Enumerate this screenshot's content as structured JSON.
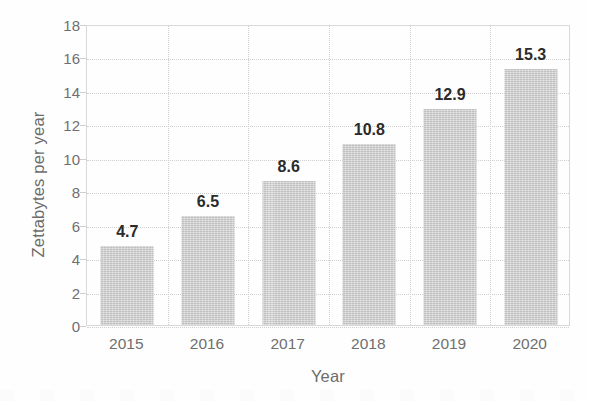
{
  "chart_data": {
    "type": "bar",
    "title": "",
    "subtitle": "",
    "xlabel": "Year",
    "ylabel": "Zettabytes per year",
    "categories": [
      "2015",
      "2016",
      "2017",
      "2018",
      "2019",
      "2020"
    ],
    "values": [
      4.7,
      6.5,
      8.6,
      10.8,
      12.9,
      15.3
    ],
    "data_labels": [
      "4.7",
      "6.5",
      "8.6",
      "10.8",
      "12.9",
      "15.3"
    ],
    "ylim": [
      0,
      18
    ],
    "ytick_values": [
      0,
      2,
      4,
      6,
      8,
      10,
      12,
      14,
      16,
      18
    ],
    "ytick_labels": [
      "0",
      "2",
      "4",
      "6",
      "8",
      "10",
      "12",
      "14",
      "16",
      "18"
    ],
    "grid": {
      "horizontal": true,
      "vertical": true,
      "style": "dotted",
      "color": "#cfcfcf"
    },
    "legend": {
      "visible": false,
      "position": "none",
      "entries": []
    },
    "series": [
      {
        "name": "Zettabytes per year",
        "color": "#cdcdcd",
        "values": [
          4.7,
          6.5,
          8.6,
          10.8,
          12.9,
          15.3
        ]
      }
    ],
    "annotations": []
  },
  "style": {
    "background_color": "#fefefe",
    "bar_color": "#cdcdcd",
    "grid_color": "#cfcfcf",
    "axis_frame_color": "#d8d8d8",
    "tick_label_color": "#6f6f6f",
    "axis_title_color": "#6d6d6d",
    "data_label_color": "#2b2b2b"
  }
}
